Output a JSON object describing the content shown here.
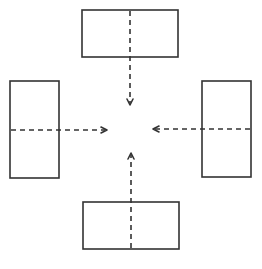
{
  "diagram": {
    "type": "convergence",
    "stroke_color": "#333333",
    "background": "#ffffff",
    "boxes": [
      {
        "id": "top",
        "x": 82,
        "y": 10,
        "w": 96,
        "h": 47
      },
      {
        "id": "left",
        "x": 10,
        "y": 81,
        "w": 49,
        "h": 97
      },
      {
        "id": "right",
        "x": 202,
        "y": 81,
        "w": 49,
        "h": 96
      },
      {
        "id": "bottom",
        "x": 83,
        "y": 202,
        "w": 96,
        "h": 47
      }
    ],
    "arrows": [
      {
        "from": "top",
        "direction": "down",
        "x1": 130,
        "y1": 10,
        "x2": 130,
        "y2": 105
      },
      {
        "from": "left",
        "direction": "right",
        "x1": 10,
        "y1": 130,
        "x2": 107,
        "y2": 130
      },
      {
        "from": "right",
        "direction": "left",
        "x1": 251,
        "y1": 129,
        "x2": 153,
        "y2": 129
      },
      {
        "from": "bottom",
        "direction": "up",
        "x1": 131,
        "y1": 249,
        "x2": 131,
        "y2": 153
      }
    ]
  }
}
